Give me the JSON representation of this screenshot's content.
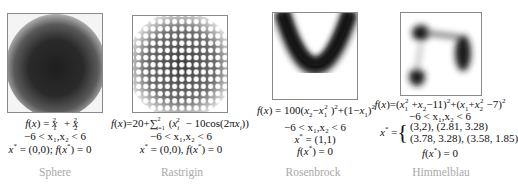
{
  "panels": [
    {
      "name": "Sphere",
      "formula": "f(x) = x1^2 + x2^2",
      "domain": "-6 < x1,x2 < 6",
      "optimum": "x* = (0,0); f(x*) = 0"
    },
    {
      "name": "Rastrigin",
      "formula": "f(x) = 20 + sum_{i=1}^{2} (xi^2 - 10cos(2πxi))",
      "domain": "-6 < x1,x2 < 6",
      "optimum": "x* = (0,0), f(x*) = 0"
    },
    {
      "name": "Rosenbrock",
      "formula": "f(x) = 100(x2 - x1^2)^2 + (1 - x1)^2",
      "domain": "-6 < x1,x2 < 6",
      "optimum_x": "x* = (1,1)",
      "optimum_f": "f(x*) = 0"
    },
    {
      "name": "Himmelblau",
      "formula": "f(x) = (x1^2 + x2 - 11)^2 + (x1 + x2^2 - 7)^2",
      "domain": "-6 < x1,x2 < 6",
      "optimum_row1": "(3,2), (2.81, 3.28)",
      "optimum_row2": "(3.78, 3.28), (3.58, 1.85)",
      "optimum_f": "f(x*) = 0"
    }
  ],
  "labels": {
    "sphere": "Sphere",
    "rastrigin": "Rastrigin",
    "rosenbrock": "Rosenbrock",
    "himmelblau": "Himmelblau",
    "domain": "−6 < x₁,x₂ < 6",
    "him_row1": "(3,2), (2.81, 3.28)",
    "him_row2": "(3.78, 3.28), (3.58, 1.85)"
  },
  "colors": {
    "frame": "#8a8a8a",
    "name_text": "#a9a9a9",
    "heat_dark": "#1e1e1e"
  }
}
